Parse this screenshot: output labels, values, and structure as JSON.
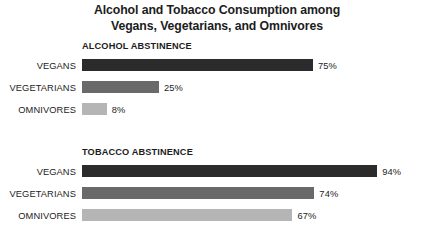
{
  "title": {
    "line1": "Alcohol and Tobacco Consumption among",
    "line2": "Vegans, Vegetarians, and Omnivores"
  },
  "sections": [
    {
      "header": "ALCOHOL ABSTINENCE",
      "rows": [
        {
          "label": "VEGANS",
          "value": 75,
          "value_label": "75%",
          "color": "#2b2b2b"
        },
        {
          "label": "VEGETARIANS",
          "value": 25,
          "value_label": "25%",
          "color": "#6a6a6a"
        },
        {
          "label": "OMNIVORES",
          "value": 8,
          "value_label": "8%",
          "color": "#b5b5b5"
        }
      ]
    },
    {
      "header": "TOBACCO ABSTINENCE",
      "rows": [
        {
          "label": "VEGANS",
          "value": 94,
          "value_label": "94%",
          "color": "#2b2b2b"
        },
        {
          "label": "VEGETARIANS",
          "value": 74,
          "value_label": "74%",
          "color": "#6a6a6a"
        },
        {
          "label": "OMNIVORES",
          "value": 67,
          "value_label": "67%",
          "color": "#b5b5b5"
        }
      ]
    }
  ],
  "chart_data": {
    "type": "bar",
    "title": "Alcohol and Tobacco Consumption among Vegans, Vegetarians, and Omnivores",
    "orientation": "horizontal",
    "xlabel": "",
    "ylabel": "",
    "xlim": [
      0,
      100
    ],
    "grid": false,
    "legend": "none",
    "units": "percent",
    "panels": [
      {
        "title": "ALCOHOL ABSTINENCE",
        "categories": [
          "VEGANS",
          "VEGETARIANS",
          "OMNIVORES"
        ],
        "values": [
          75,
          25,
          8
        ],
        "data_labels": [
          "75%",
          "25%",
          "8%"
        ],
        "colors": [
          "#2b2b2b",
          "#6a6a6a",
          "#b5b5b5"
        ]
      },
      {
        "title": "TOBACCO ABSTINENCE",
        "categories": [
          "VEGANS",
          "VEGETARIANS",
          "OMNIVORES"
        ],
        "values": [
          94,
          74,
          67
        ],
        "data_labels": [
          "94%",
          "74%",
          "67%"
        ],
        "colors": [
          "#2b2b2b",
          "#6a6a6a",
          "#b5b5b5"
        ]
      }
    ]
  },
  "render": {
    "bar_origin_x": 82,
    "px_per_percent_alcohol": 3.08,
    "px_per_percent_tobacco": 3.14,
    "value_gap_px": 5
  }
}
